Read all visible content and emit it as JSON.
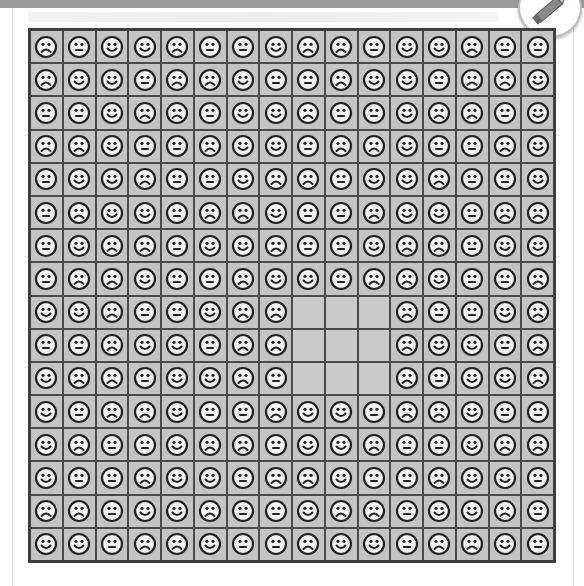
{
  "puzzle": {
    "rows": 16,
    "cols": 16,
    "legend": {
      "H": "happy-face",
      "N": "neutral-face",
      "S": "sad-face",
      "_": "empty"
    },
    "grid": [
      [
        "S",
        "N",
        "H",
        "H",
        "S",
        "N",
        "N",
        "H",
        "S",
        "S",
        "N",
        "H",
        "H",
        "S",
        "N",
        "N"
      ],
      [
        "S",
        "H",
        "H",
        "N",
        "S",
        "S",
        "H",
        "N",
        "N",
        "S",
        "H",
        "H",
        "N",
        "S",
        "S",
        "H"
      ],
      [
        "N",
        "N",
        "H",
        "S",
        "S",
        "N",
        "H",
        "H",
        "S",
        "N",
        "N",
        "H",
        "S",
        "S",
        "N",
        "H"
      ],
      [
        "S",
        "S",
        "H",
        "N",
        "N",
        "S",
        "H",
        "H",
        "N",
        "S",
        "S",
        "H",
        "N",
        "N",
        "S",
        "H"
      ],
      [
        "N",
        "H",
        "H",
        "S",
        "N",
        "N",
        "H",
        "S",
        "S",
        "N",
        "H",
        "H",
        "S",
        "N",
        "N",
        "H"
      ],
      [
        "N",
        "S",
        "H",
        "H",
        "N",
        "S",
        "S",
        "H",
        "N",
        "N",
        "S",
        "H",
        "H",
        "N",
        "S",
        "S"
      ],
      [
        "N",
        "H",
        "S",
        "S",
        "N",
        "H",
        "H",
        "S",
        "N",
        "N",
        "H",
        "S",
        "S",
        "N",
        "H",
        "H"
      ],
      [
        "N",
        "S",
        "S",
        "H",
        "N",
        "N",
        "S",
        "H",
        "H",
        "N",
        "S",
        "S",
        "H",
        "N",
        "N",
        "S"
      ],
      [
        "H",
        "H",
        "S",
        "N",
        "N",
        "H",
        "S",
        "S",
        "_",
        "_",
        "_",
        "S",
        "N",
        "N",
        "H",
        "S"
      ],
      [
        "N",
        "N",
        "S",
        "H",
        "H",
        "N",
        "S",
        "S",
        "_",
        "_",
        "_",
        "S",
        "H",
        "H",
        "N",
        "S"
      ],
      [
        "H",
        "S",
        "S",
        "N",
        "H",
        "H",
        "S",
        "N",
        "_",
        "_",
        "_",
        "S",
        "N",
        "H",
        "H",
        "S"
      ],
      [
        "H",
        "N",
        "S",
        "S",
        "H",
        "N",
        "N",
        "S",
        "H",
        "H",
        "N",
        "S",
        "S",
        "H",
        "N",
        "N"
      ],
      [
        "H",
        "S",
        "N",
        "N",
        "H",
        "S",
        "S",
        "N",
        "H",
        "H",
        "S",
        "N",
        "N",
        "H",
        "S",
        "S"
      ],
      [
        "H",
        "N",
        "N",
        "S",
        "H",
        "H",
        "N",
        "S",
        "S",
        "H",
        "N",
        "N",
        "S",
        "H",
        "H",
        "N"
      ],
      [
        "S",
        "S",
        "N",
        "H",
        "H",
        "S",
        "N",
        "N",
        "H",
        "S",
        "S",
        "N",
        "H",
        "H",
        "S",
        "N"
      ],
      [
        "H",
        "H",
        "N",
        "S",
        "S",
        "H",
        "N",
        "N",
        "S",
        "H",
        "H",
        "N",
        "S",
        "S",
        "H",
        "N"
      ]
    ]
  },
  "colors": {
    "cell_bg": "#c4c4c4",
    "grid_line": "#4a4a4a",
    "face_fill": "#f2f2f2",
    "face_stroke": "#222222",
    "header_bar": "#9a9a9a"
  },
  "icons": {
    "badge": "pencil-icon"
  }
}
